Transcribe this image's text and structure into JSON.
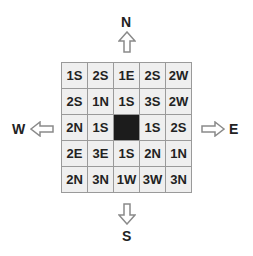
{
  "header": {
    "partial_text": "...maze puzzle directions..."
  },
  "compass": {
    "north": "N",
    "south": "S",
    "east": "E",
    "west": "W"
  },
  "grid": {
    "rows": [
      [
        "1S",
        "2S",
        "1E",
        "2S",
        "2W"
      ],
      [
        "2S",
        "1N",
        "1S",
        "3S",
        "2W"
      ],
      [
        "2N",
        "1S",
        "",
        "1S",
        "2S"
      ],
      [
        "2E",
        "3E",
        "1S",
        "2N",
        "1N"
      ],
      [
        "2N",
        "3N",
        "1W",
        "3W",
        "3N"
      ]
    ],
    "goal_cell": {
      "row": 2,
      "col": 2
    }
  },
  "colors": {
    "cell_bg": "#efefef",
    "cell_border": "#9a9a9a",
    "goal": "#1c1c1c",
    "arrow": "#8a8a8a"
  }
}
